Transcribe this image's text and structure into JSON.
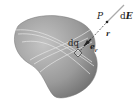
{
  "diagram": {
    "labels": {
      "point": "P",
      "field_d": "d",
      "field_E": "E",
      "distance": "r",
      "charge": "dq",
      "unit_vector_e": "e",
      "unit_vector_sub": "r"
    },
    "colors": {
      "body_light": "#b8b8b8",
      "body_dark": "#6e6e6e",
      "arc_lines": "#e6e6e6",
      "line": "#555555",
      "text": "#222222"
    }
  }
}
